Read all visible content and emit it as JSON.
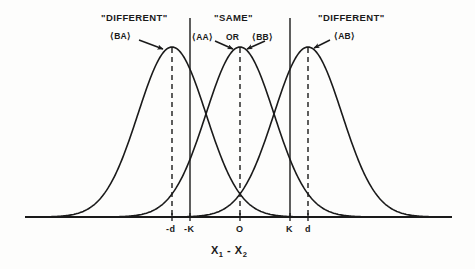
{
  "figure": {
    "background_color": "#fdfdfc",
    "ink_color": "#1a1a1a",
    "x_axis_label_part1": "X",
    "x_axis_label_sub1": "1",
    "x_axis_label_minus": " - ",
    "x_axis_label_part2": "X",
    "x_axis_label_sub2": "2"
  },
  "category_labels": {
    "left": "\"DIFFERENT\"",
    "center": "\"SAME\"",
    "right": "\"DIFFERENT\""
  },
  "curve_tags": {
    "ba": "⟨BA⟩",
    "aa": "⟨AA⟩",
    "or": "OR",
    "bb": "⟨BB⟩",
    "ab": "⟨AB⟩"
  },
  "tick_labels": [
    {
      "text": "-d",
      "x": 172
    },
    {
      "text": "-K",
      "x": 190
    },
    {
      "text": "O",
      "x": 240
    },
    {
      "text": "K",
      "x": 290
    },
    {
      "text": "d",
      "x": 308
    }
  ],
  "chart_data": {
    "type": "line",
    "title": "",
    "subtitle": "",
    "xlabel": "X1 - X2",
    "ylabel": "",
    "grid": false,
    "legend_position": "inline-annotations",
    "axis": {
      "baseline_y": 217,
      "x_start": 25,
      "x_end": 452,
      "peak_y": 47
    },
    "xlim": [
      -2.6,
      2.6
    ],
    "ylim": [
      0,
      1
    ],
    "distributions": [
      {
        "name": "⟨BA⟩",
        "mean_label": "-d",
        "mean_px": 172,
        "sigma_px": 34,
        "peak_px_y": 47,
        "category": "\"DIFFERENT\""
      },
      {
        "name": "⟨AA⟩ OR ⟨BB⟩",
        "mean_label": "O",
        "mean_px": 240,
        "sigma_px": 34,
        "peak_px_y": 47,
        "category": "\"SAME\""
      },
      {
        "name": "⟨AB⟩",
        "mean_label": "d",
        "mean_px": 308,
        "sigma_px": 34,
        "peak_px_y": 47,
        "category": "\"DIFFERENT\""
      }
    ],
    "criterion_lines": [
      {
        "label": "-K",
        "x_px": 190,
        "style": "solid"
      },
      {
        "label": "K",
        "x_px": 290,
        "style": "solid"
      }
    ],
    "mean_lines": [
      {
        "label": "-d",
        "x_px": 172,
        "style": "dashed"
      },
      {
        "label": "O",
        "x_px": 240,
        "style": "dashed"
      },
      {
        "label": "d",
        "x_px": 308,
        "style": "dashed"
      }
    ]
  }
}
